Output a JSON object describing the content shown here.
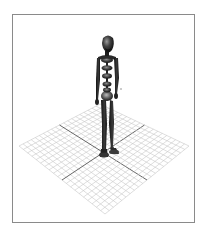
{
  "figure": {
    "caption": "3D skeletal mannequin figure standing on a ground grid",
    "ground": "perspective-grid"
  },
  "colors": {
    "frame_border": "#8a8a8a",
    "background": "#ffffff",
    "grid_line": "#c8c8c8",
    "grid_axis": "#555555",
    "figure_dark": "#1e1e1e",
    "figure_mid": "#4a4a4a",
    "figure_highlight": "#8c8c8c"
  },
  "grid": {
    "divisions": 20,
    "top": [
      100,
      104
    ],
    "right": [
      189,
      146
    ],
    "bottom": [
      105,
      214
    ],
    "left": [
      19,
      146
    ]
  }
}
